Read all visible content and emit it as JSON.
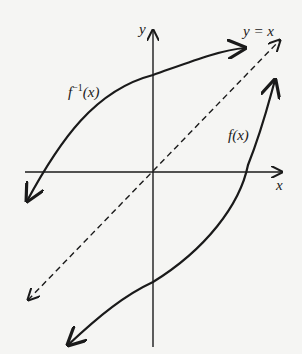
{
  "diagram": {
    "labels": {
      "y_axis": "y",
      "x_axis": "x",
      "identity_line": "y = x",
      "inverse_base": "f",
      "inverse_sup": "−1",
      "inverse_arg": "(x)",
      "function": "f(x)"
    },
    "colors": {
      "background": "#f5f5f3",
      "ink": "#1a1a1a"
    },
    "elements": [
      {
        "name": "x-axis",
        "style": "solid",
        "arrow": "right"
      },
      {
        "name": "y-axis",
        "style": "solid",
        "arrow": "up"
      },
      {
        "name": "identity-line",
        "style": "dashed",
        "arrows": "both"
      },
      {
        "name": "f-inverse-curve",
        "style": "solid",
        "arrows": "both"
      },
      {
        "name": "f-curve",
        "style": "solid",
        "arrows": "both"
      }
    ]
  }
}
